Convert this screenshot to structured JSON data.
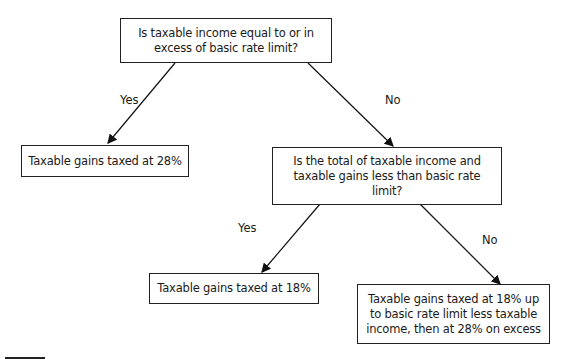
{
  "diagram": {
    "type": "decision-tree",
    "nodes": {
      "q1": {
        "text": "Is taxable income equal to or in excess of basic rate limit?"
      },
      "r1": {
        "text": "Taxable gains taxed at 28%"
      },
      "q2": {
        "text": "Is the total of taxable income and taxable gains less than basic rate limit?"
      },
      "r2": {
        "text": "Taxable gains taxed at 18%"
      },
      "r3": {
        "text": "Taxable gains taxed at 18% up to basic rate limit less taxable income, then at 28% on excess"
      }
    },
    "edges": [
      {
        "from": "q1",
        "to": "r1",
        "label": "Yes"
      },
      {
        "from": "q1",
        "to": "q2",
        "label": "No"
      },
      {
        "from": "q2",
        "to": "r2",
        "label": "Yes"
      },
      {
        "from": "q2",
        "to": "r3",
        "label": "No"
      }
    ]
  }
}
